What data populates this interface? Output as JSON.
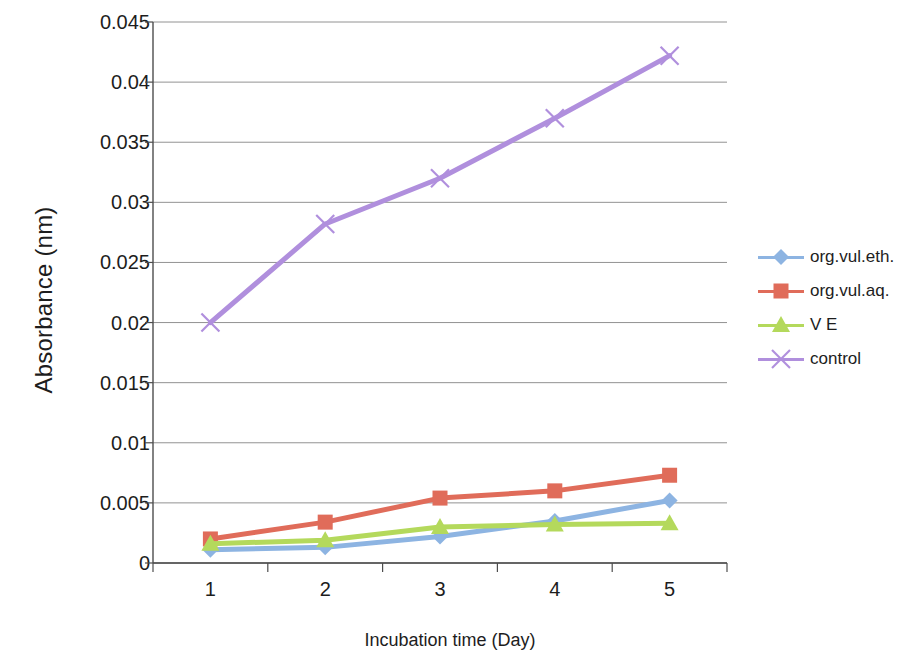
{
  "chart_data": {
    "type": "line",
    "title": "",
    "xlabel": "Incubation time (Day)",
    "ylabel": "Absorbance (nm)",
    "categories": [
      "1",
      "2",
      "3",
      "4",
      "5"
    ],
    "x": [
      1,
      2,
      3,
      4,
      5
    ],
    "ylim": [
      0,
      0.045
    ],
    "ytick_labels": [
      "0",
      "0.005",
      "0.01",
      "0.015",
      "0.02",
      "0.025",
      "0.03",
      "0.035",
      "0.04",
      "0.045"
    ],
    "ytick_values": [
      0,
      0.005,
      0.01,
      0.015,
      0.02,
      0.025,
      0.03,
      0.035,
      0.04,
      0.045
    ],
    "grid": "horizontal",
    "legend_position": "right",
    "series": [
      {
        "name": "org.vul.eth.",
        "color": "#8db4e2",
        "marker": "diamond",
        "values": [
          0.0011,
          0.0013,
          0.0022,
          0.0035,
          0.0052
        ]
      },
      {
        "name": "org.vul.aq.",
        "color": "#e06c5a",
        "marker": "square",
        "values": [
          0.002,
          0.0034,
          0.0054,
          0.006,
          0.0073
        ]
      },
      {
        "name": "V E",
        "color": "#b4d95c",
        "marker": "triangle",
        "values": [
          0.0016,
          0.0019,
          0.003,
          0.0032,
          0.0033
        ]
      },
      {
        "name": "control",
        "color": "#b08fdd",
        "marker": "cross",
        "values": [
          0.02,
          0.0282,
          0.032,
          0.037,
          0.0422
        ]
      }
    ]
  },
  "axes": {
    "y_title": "Absorbance (nm)",
    "x_title": "Incubation time (Day)"
  },
  "legend": {
    "items": [
      {
        "label": "org.vul.eth."
      },
      {
        "label": "org.vul.aq."
      },
      {
        "label": "V E"
      },
      {
        "label": "control"
      }
    ]
  },
  "colors": {
    "series_1": "#8db4e2",
    "series_2": "#e06c5a",
    "series_3": "#b4d95c",
    "series_4": "#b08fdd",
    "grid": "#808080",
    "axis": "#4d4d4d",
    "text": "#1d1d1d"
  }
}
